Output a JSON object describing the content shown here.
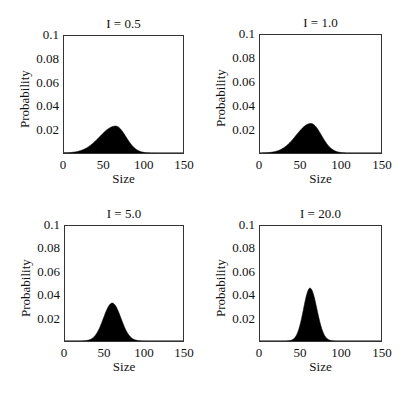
{
  "chart_data": [
    {
      "type": "area",
      "title": "I = 0.5",
      "xlabel": "Size",
      "ylabel": "Probability",
      "xlim": [
        0,
        150
      ],
      "ylim": [
        0,
        0.1
      ],
      "xticks": [
        "0",
        "50",
        "100",
        "150"
      ],
      "yticks": [
        "0.1",
        "0.08",
        "0.06",
        "0.04",
        "0.02"
      ],
      "grid": false,
      "fill_color": "#000000",
      "curve": {
        "peak_x": 65,
        "peak_y": 0.023,
        "sigma_left": 20,
        "sigma_right": 13
      },
      "x": [
        0,
        10,
        20,
        30,
        40,
        50,
        60,
        65,
        70,
        80,
        90,
        100,
        110,
        150
      ],
      "values": [
        0.0002,
        0.0008,
        0.0022,
        0.0047,
        0.0093,
        0.0151,
        0.0208,
        0.023,
        0.0214,
        0.0118,
        0.0035,
        0.0006,
        0.0001,
        0
      ]
    },
    {
      "type": "area",
      "title": "I = 1.0",
      "xlabel": "Size",
      "ylabel": "Probability",
      "xlim": [
        0,
        150
      ],
      "ylim": [
        0,
        0.1
      ],
      "xticks": [
        "0",
        "50",
        "100",
        "150"
      ],
      "yticks": [
        "0.1",
        "0.08",
        "0.06",
        "0.04",
        "0.02"
      ],
      "grid": false,
      "fill_color": "#000000",
      "curve": {
        "peak_x": 63,
        "peak_y": 0.025,
        "sigma_left": 18,
        "sigma_right": 13
      },
      "x": [
        0,
        10,
        20,
        30,
        40,
        50,
        60,
        63,
        70,
        80,
        90,
        100,
        110,
        150
      ],
      "values": [
        0.0002,
        0.0006,
        0.0016,
        0.0047,
        0.0099,
        0.0192,
        0.0243,
        0.025,
        0.0216,
        0.0106,
        0.0029,
        0.0004,
        0.0001,
        0
      ]
    },
    {
      "type": "area",
      "title": "I = 5.0",
      "xlabel": "Size",
      "ylabel": "Probability",
      "xlim": [
        0,
        150
      ],
      "ylim": [
        0,
        0.1
      ],
      "xticks": [
        "0",
        "50",
        "100",
        "150"
      ],
      "yticks": [
        "0.1",
        "0.08",
        "0.06",
        "0.04",
        "0.02"
      ],
      "grid": false,
      "fill_color": "#000000",
      "curve": {
        "peak_x": 60,
        "peak_y": 0.033,
        "sigma_left": 11,
        "sigma_right": 11
      },
      "x": [
        0,
        20,
        30,
        40,
        50,
        60,
        70,
        80,
        90,
        100,
        150
      ],
      "values": [
        0,
        0.0004,
        0.0008,
        0.0063,
        0.0222,
        0.033,
        0.0222,
        0.0063,
        0.0008,
        0.0001,
        0
      ]
    },
    {
      "type": "area",
      "title": "I = 20.0",
      "xlabel": "Size",
      "ylabel": "Probability",
      "xlim": [
        0,
        150
      ],
      "ylim": [
        0,
        0.1
      ],
      "xticks": [
        "0",
        "50",
        "100",
        "150"
      ],
      "yticks": [
        "0.1",
        "0.08",
        "0.06",
        "0.04",
        "0.02"
      ],
      "grid": false,
      "fill_color": "#000000",
      "curve": {
        "peak_x": 62,
        "peak_y": 0.046,
        "sigma_left": 8,
        "sigma_right": 8.5
      },
      "x": [
        0,
        40,
        50,
        55,
        62,
        70,
        75,
        85,
        100,
        150
      ],
      "values": [
        0,
        0.0011,
        0.0149,
        0.031,
        0.046,
        0.0295,
        0.0143,
        0.0012,
        0,
        0
      ]
    }
  ],
  "panels": [
    {
      "frame": {
        "left": 63,
        "top": 35,
        "width": 121,
        "height": 119
      },
      "title": "I = 0.5"
    },
    {
      "frame": {
        "left": 259,
        "top": 34,
        "width": 123,
        "height": 120
      },
      "title": "I = 1.0"
    },
    {
      "frame": {
        "left": 64,
        "top": 225,
        "width": 120,
        "height": 117
      },
      "title": "I = 5.0"
    },
    {
      "frame": {
        "left": 259,
        "top": 225,
        "width": 123,
        "height": 117
      },
      "title": "I = 20.0"
    }
  ]
}
